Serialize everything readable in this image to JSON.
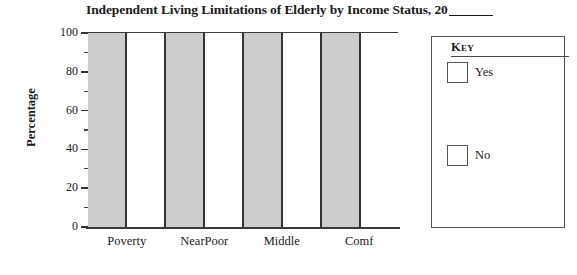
{
  "chart_data": {
    "type": "bar",
    "title": "Independent Living Limitations of Elderly by Income Status, 20",
    "title_blank_suffix": "____",
    "xlabel": "",
    "ylabel": "Percentage",
    "categories": [
      "Poverty",
      "NearPoor",
      "Middle",
      "Comf"
    ],
    "series": [
      {
        "name": "Yes",
        "values": [
          100,
          100,
          100,
          100
        ],
        "color": "#cccccc"
      },
      {
        "name": "No",
        "values": [
          100,
          100,
          100,
          100
        ],
        "color": "#ffffff"
      }
    ],
    "bands": [
      {
        "series": "Yes",
        "category": "Poverty",
        "value": 100,
        "fill": "#cccccc"
      },
      {
        "series": "No",
        "category": "Poverty",
        "value": 100,
        "fill": "#ffffff"
      },
      {
        "series": "Yes",
        "category": "NearPoor",
        "value": 100,
        "fill": "#cccccc"
      },
      {
        "series": "No",
        "category": "NearPoor",
        "value": 100,
        "fill": "#ffffff"
      },
      {
        "series": "Yes",
        "category": "Middle",
        "value": 100,
        "fill": "#cccccc"
      },
      {
        "series": "No",
        "category": "Middle",
        "value": 100,
        "fill": "#ffffff"
      },
      {
        "series": "Yes",
        "category": "Comf",
        "value": 100,
        "fill": "#cccccc"
      },
      {
        "series": "No",
        "category": "Comf",
        "value": 100,
        "fill": "#ffffff"
      }
    ],
    "ylim": [
      0,
      100
    ],
    "ytick_labels": [
      "100",
      "80",
      "60",
      "40",
      "20",
      "0"
    ],
    "ytick_values": [
      100,
      80,
      60,
      40,
      20,
      0
    ],
    "yminor_values": [
      90,
      70,
      50,
      30,
      10
    ],
    "grid": false,
    "legend_position": "right",
    "legend": {
      "title": "Key",
      "entries": [
        {
          "label": "Yes",
          "swatch_color": "#ffffff"
        },
        {
          "label": "No",
          "swatch_color": "#ffffff"
        }
      ]
    }
  },
  "colors": {
    "axis": "#333333",
    "bar_border": "#333333",
    "yes_fill": "#cccccc",
    "no_fill": "#ffffff",
    "legend_border": "#555555",
    "text": "#1a1a1a"
  }
}
